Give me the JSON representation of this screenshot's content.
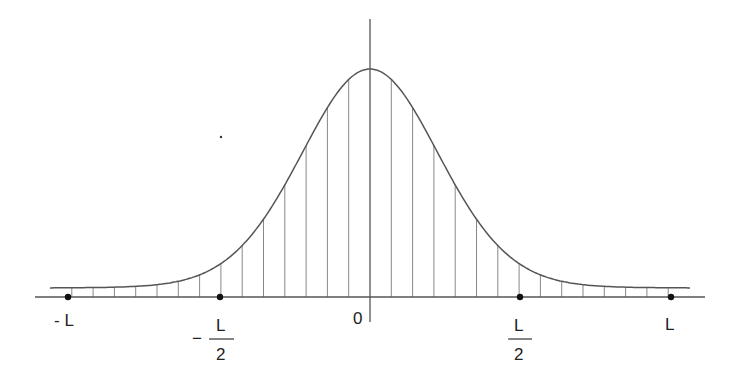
{
  "figure": {
    "colors": {
      "line": "#555555",
      "hatch": "#888888",
      "dot": "#111111",
      "text": "#222222",
      "background": "#ffffff"
    },
    "axes": {
      "origin_px": [
        370,
        297
      ],
      "x_axis_px": {
        "from": 35,
        "to": 705
      },
      "y_axis_px": {
        "from": 19,
        "to": 322
      }
    },
    "curve": {
      "peak_px": [
        370,
        69
      ],
      "tail_level_px": 288,
      "left_end_px": 50,
      "right_end_px": 690,
      "half_width_px": 95
    },
    "hatch": {
      "spacing_px": 21.3,
      "count_each_side": 15
    },
    "markers": [
      {
        "id": "minus-L",
        "x_px": 68
      },
      {
        "id": "minus-half-L",
        "x_px": 220
      },
      {
        "id": "half-L",
        "x_px": 520
      },
      {
        "id": "L",
        "x_px": 671
      }
    ]
  },
  "labels": {
    "minus_L": "- L",
    "minus_half_sign": "−",
    "minus_half_num": "L",
    "minus_half_den": "2",
    "zero": "0",
    "half_num": "L",
    "half_den": "2",
    "L": "L"
  }
}
